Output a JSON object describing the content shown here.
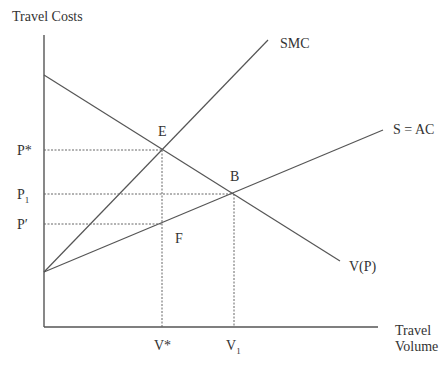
{
  "diagram": {
    "axes": {
      "y_label": "Travel Costs",
      "x_label_line1": "Travel",
      "x_label_line2": "Volume"
    },
    "curves": {
      "smc": "SMC",
      "ac": "S = AC",
      "demand": "V(P)"
    },
    "points": {
      "e": "E",
      "b": "B",
      "f": "F"
    },
    "price_levels": {
      "p_star": "P*",
      "p1_base": "P",
      "p1_sub": "1",
      "p_prime": "P′"
    },
    "volume_levels": {
      "v_star": "V*",
      "v1_base": "V",
      "v1_sub": "1"
    }
  },
  "colors": {
    "line": "#555555",
    "text": "#333333",
    "background": "#ffffff"
  }
}
